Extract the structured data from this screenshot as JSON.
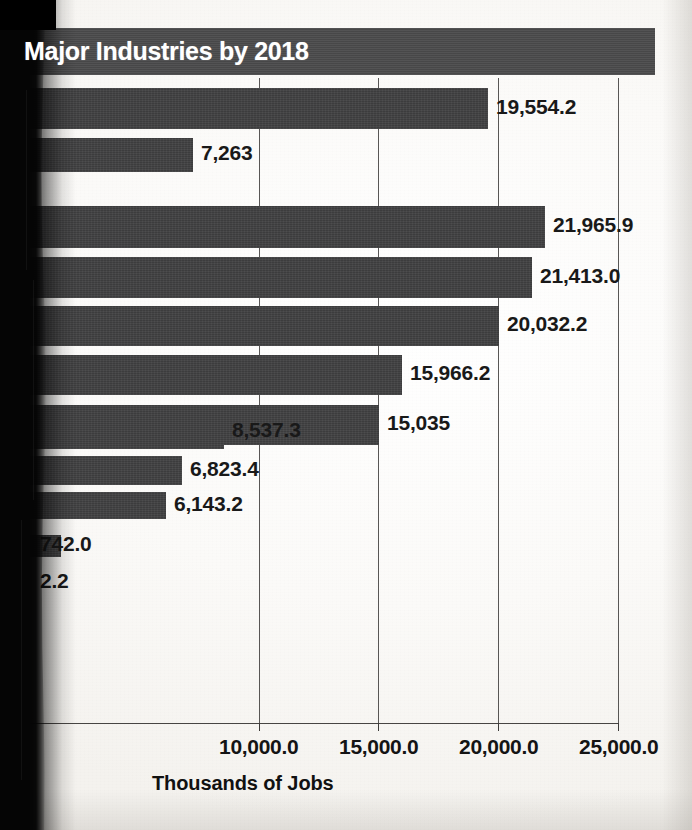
{
  "chart_data": {
    "type": "bar",
    "orientation": "horizontal",
    "title": "Major Industries by 2018",
    "xlabel": "Thousands of Jobs",
    "ylabel": "",
    "xlim": [
      0,
      25000
    ],
    "xticks": [
      0,
      10000,
      15000,
      20000,
      25000
    ],
    "xtick_labels": [
      "0",
      "10,000.0",
      "15,000.0",
      "20,000.0",
      "25,000.0"
    ],
    "grid": true,
    "legend": "none",
    "bar_color": "#3f3f40",
    "categories": [
      "bar-1",
      "bar-2",
      "bar-3",
      "bar-4",
      "bar-5",
      "bar-6",
      "bar-7",
      "bar-8",
      "bar-9",
      "bar-10",
      "bar-11",
      "bar-12",
      "bar-13"
    ],
    "values": [
      25300.0,
      19554.2,
      7263.0,
      21965.9,
      21413.0,
      20032.2,
      15966.2,
      15035.0,
      8537.3,
      6823.4,
      6143.2,
      1742.0,
      2.2
    ],
    "data_labels": [
      "",
      "19,554.2",
      "7,263",
      "21,965.9",
      "21,413.0",
      "20,032.2",
      "15,966.2",
      "15,035",
      "8,537.3",
      "6,823.4",
      "6,143.2",
      "742.0",
      "2.2"
    ]
  },
  "bars": [
    {
      "label": "",
      "value": 25300.0,
      "top": 28,
      "height": 47,
      "is_title_banner": true
    },
    {
      "label": "19,554.2",
      "value": 19554.2,
      "top": 88,
      "height": 41
    },
    {
      "label": "7,263",
      "value": 7263.0,
      "top": 138,
      "height": 34
    },
    {
      "label": "21,965.9",
      "value": 21965.9,
      "top": 206,
      "height": 42
    },
    {
      "label": "21,413.0",
      "value": 21413.0,
      "top": 257,
      "height": 41
    },
    {
      "label": "20,032.2",
      "value": 20032.2,
      "top": 306,
      "height": 40
    },
    {
      "label": "15,966.2",
      "value": 15966.2,
      "top": 355,
      "height": 40
    },
    {
      "label": "15,035",
      "value": 15035.0,
      "top": 405,
      "height": 40
    },
    {
      "label": "8,537.3",
      "value": 8537.3,
      "top": 415,
      "height": 34,
      "offset": true
    },
    {
      "label": "6,823.4",
      "value": 6823.4,
      "top": 456,
      "height": 29
    },
    {
      "label": "6,143.2",
      "value": 6143.2,
      "top": 492,
      "height": 27
    },
    {
      "label": "742.0",
      "value": 1742.0,
      "top": 535,
      "height": 22
    },
    {
      "label": "2.2",
      "value": 2.2,
      "top": 574,
      "height": 18
    }
  ],
  "axis": {
    "ticks": [
      {
        "label": "0",
        "value": 0
      },
      {
        "label": "10,000.0",
        "value": 10000
      },
      {
        "label": "15,000.0",
        "value": 15000
      },
      {
        "label": "20,000.0",
        "value": 20000
      },
      {
        "label": "25,000.0",
        "value": 25000
      }
    ],
    "title": "Thousands of Jobs"
  },
  "colors": {
    "bar": "#3f3f40",
    "title_banner": "#4a4a4b",
    "title_text": "#ffffff",
    "gridline": "#4a4846",
    "label_text": "#191919",
    "paper": "#fbfaf8",
    "gutter_shadow": "#050505"
  }
}
